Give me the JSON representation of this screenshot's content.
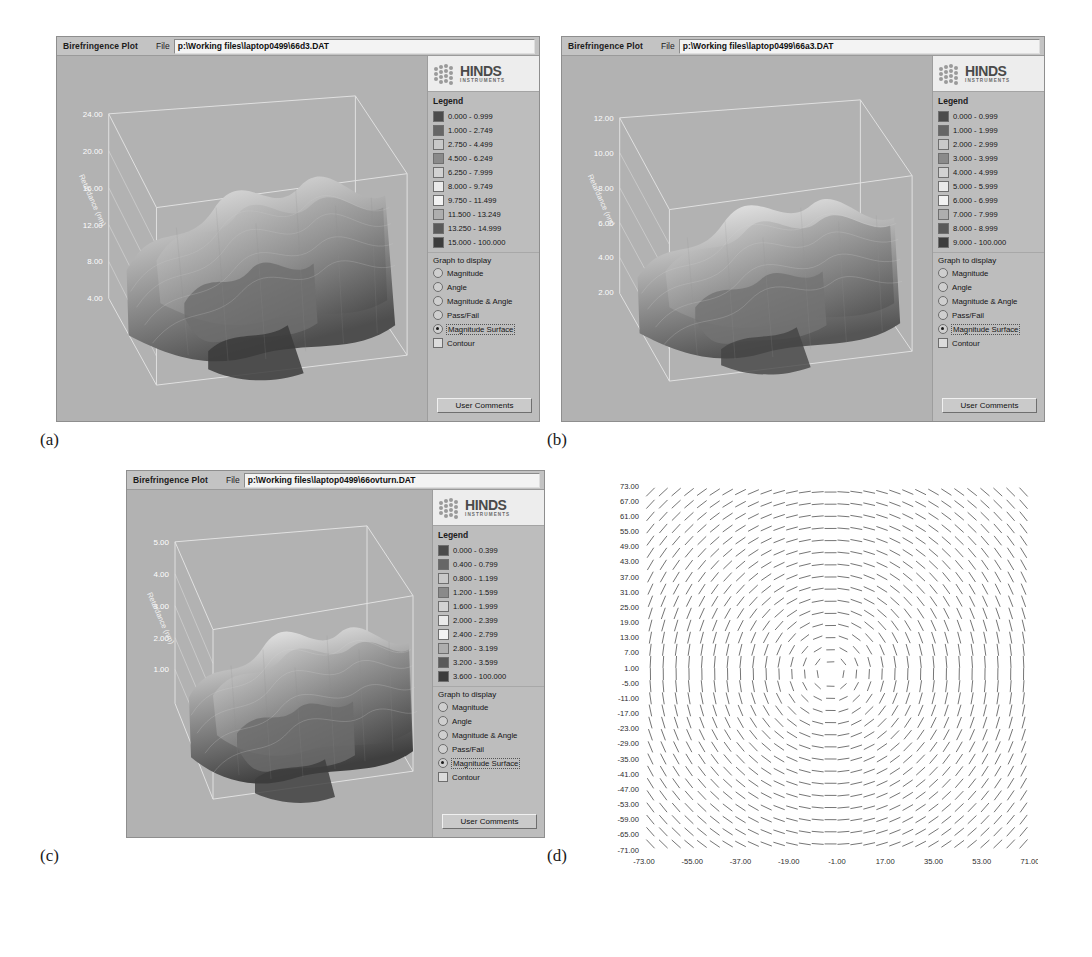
{
  "figure": {
    "panels": [
      {
        "caption": "(a)",
        "window": {
          "app_title": "Birefringence Plot",
          "file_label": "File",
          "file_value": "p:\\Working files\\laptop0499\\66d3.DAT"
        },
        "logo": {
          "name": "HINDS",
          "sub": "INSTRUMENTS"
        },
        "legend": {
          "title": "Legend",
          "entries": [
            {
              "label": "0.000 - 0.999",
              "color": "#4b4b4b"
            },
            {
              "label": "1.000 - 2.749",
              "color": "#666666"
            },
            {
              "label": "2.750 - 4.499",
              "color": "#c9c9c9"
            },
            {
              "label": "4.500 - 6.249",
              "color": "#8a8a8a"
            },
            {
              "label": "6.250 - 7.999",
              "color": "#d2d2d2"
            },
            {
              "label": "8.000 - 9.749",
              "color": "#eaeaea"
            },
            {
              "label": "9.750 - 11.499",
              "color": "#f2f2f2"
            },
            {
              "label": "11.500 - 13.249",
              "color": "#aeaeae"
            },
            {
              "label": "13.250 - 14.999",
              "color": "#5a5a5a"
            },
            {
              "label": "15.000 - 100.000",
              "color": "#3c3c3c"
            }
          ]
        },
        "graph_to_display": {
          "title": "Graph to display",
          "options": [
            {
              "label": "Magnitude",
              "type": "radio",
              "selected": false
            },
            {
              "label": "Angle",
              "type": "radio",
              "selected": false
            },
            {
              "label": "Magnitude & Angle",
              "type": "radio",
              "selected": false
            },
            {
              "label": "Pass/Fail",
              "type": "radio",
              "selected": false
            },
            {
              "label": "Magnitude Surface",
              "type": "radio",
              "selected": true
            },
            {
              "label": "Contour",
              "type": "checkbox",
              "selected": false
            }
          ],
          "button": "User Comments"
        },
        "axis": {
          "z_label": "Retardance (nm)",
          "z_ticks": [
            "24.00",
            "20.00",
            "16.00",
            "12.00",
            "8.00",
            "4.00"
          ]
        }
      },
      {
        "caption": "(b)",
        "window": {
          "app_title": "Birefringence Plot",
          "file_label": "File",
          "file_value": "p:\\Working files\\laptop0499\\66a3.DAT"
        },
        "logo": {
          "name": "HINDS",
          "sub": "INSTRUMENTS"
        },
        "legend": {
          "title": "Legend",
          "entries": [
            {
              "label": "0.000 - 0.999",
              "color": "#4b4b4b"
            },
            {
              "label": "1.000 - 1.999",
              "color": "#666666"
            },
            {
              "label": "2.000 - 2.999",
              "color": "#c9c9c9"
            },
            {
              "label": "3.000 - 3.999",
              "color": "#8a8a8a"
            },
            {
              "label": "4.000 - 4.999",
              "color": "#d2d2d2"
            },
            {
              "label": "5.000 - 5.999",
              "color": "#eaeaea"
            },
            {
              "label": "6.000 - 6.999",
              "color": "#f2f2f2"
            },
            {
              "label": "7.000 - 7.999",
              "color": "#aeaeae"
            },
            {
              "label": "8.000 - 8.999",
              "color": "#5a5a5a"
            },
            {
              "label": "9.000 - 100.000",
              "color": "#3c3c3c"
            }
          ]
        },
        "graph_to_display": {
          "title": "Graph to display",
          "options": [
            {
              "label": "Magnitude",
              "type": "radio",
              "selected": false
            },
            {
              "label": "Angle",
              "type": "radio",
              "selected": false
            },
            {
              "label": "Magnitude & Angle",
              "type": "radio",
              "selected": false
            },
            {
              "label": "Pass/Fail",
              "type": "radio",
              "selected": false
            },
            {
              "label": "Magnitude Surface",
              "type": "radio",
              "selected": true
            },
            {
              "label": "Contour",
              "type": "checkbox",
              "selected": false
            }
          ],
          "button": "User Comments"
        },
        "axis": {
          "z_label": "Retardance (nm)",
          "z_ticks": [
            "12.00",
            "10.00",
            "8.00",
            "6.00",
            "4.00",
            "2.00"
          ]
        }
      },
      {
        "caption": "(c)",
        "window": {
          "app_title": "Birefringence Plot",
          "file_label": "File",
          "file_value": "p:\\Working files\\laptop0499\\66ovturn.DAT"
        },
        "logo": {
          "name": "HINDS",
          "sub": "INSTRUMENTS"
        },
        "legend": {
          "title": "Legend",
          "entries": [
            {
              "label": "0.000 - 0.399",
              "color": "#4b4b4b"
            },
            {
              "label": "0.400 - 0.799",
              "color": "#666666"
            },
            {
              "label": "0.800 - 1.199",
              "color": "#c9c9c9"
            },
            {
              "label": "1.200 - 1.599",
              "color": "#8a8a8a"
            },
            {
              "label": "1.600 - 1.999",
              "color": "#d2d2d2"
            },
            {
              "label": "2.000 - 2.399",
              "color": "#eaeaea"
            },
            {
              "label": "2.400 - 2.799",
              "color": "#f2f2f2"
            },
            {
              "label": "2.800 - 3.199",
              "color": "#aeaeae"
            },
            {
              "label": "3.200 - 3.599",
              "color": "#5a5a5a"
            },
            {
              "label": "3.600 - 100.000",
              "color": "#3c3c3c"
            }
          ]
        },
        "graph_to_display": {
          "title": "Graph to display",
          "options": [
            {
              "label": "Magnitude",
              "type": "radio",
              "selected": false
            },
            {
              "label": "Angle",
              "type": "radio",
              "selected": false
            },
            {
              "label": "Magnitude & Angle",
              "type": "radio",
              "selected": false
            },
            {
              "label": "Pass/Fail",
              "type": "radio",
              "selected": false
            },
            {
              "label": "Magnitude Surface",
              "type": "radio",
              "selected": true
            },
            {
              "label": "Contour",
              "type": "checkbox",
              "selected": false
            }
          ],
          "button": "User Comments"
        },
        "axis": {
          "z_label": "Retardance (nm)",
          "z_ticks": [
            "5.00",
            "4.00",
            "3.00",
            "2.00",
            "1.00"
          ]
        }
      }
    ],
    "vector_panel": {
      "caption": "(d)",
      "y_ticks": [
        "73.00",
        "67.00",
        "61.00",
        "55.00",
        "49.00",
        "43.00",
        "37.00",
        "31.00",
        "25.00",
        "19.00",
        "13.00",
        "7.00",
        "1.00",
        "-5.00",
        "-11.00",
        "-17.00",
        "-23.00",
        "-29.00",
        "-35.00",
        "-41.00",
        "-47.00",
        "-53.00",
        "-59.00",
        "-65.00",
        "-71.00"
      ],
      "x_ticks": [
        "-73.00",
        "-55.00",
        "-37.00",
        "-19.00",
        "-1.00",
        "17.00",
        "35.00",
        "53.00",
        "71.00"
      ]
    }
  },
  "chart_data": {
    "type": "scatter",
    "panels": [
      {
        "id": "a",
        "type": "surface",
        "file": "p:\\Working files\\laptop0499\\66d3.DAT",
        "zlabel": "Retardance (nm)",
        "z_ticks": [
          24.0,
          20.0,
          16.0,
          12.0,
          8.0,
          4.0
        ],
        "zlim": [
          0,
          24
        ],
        "legend_bins": [
          [
            0.0,
            0.999
          ],
          [
            1.0,
            2.749
          ],
          [
            2.75,
            4.499
          ],
          [
            4.5,
            6.249
          ],
          [
            6.25,
            7.999
          ],
          [
            8.0,
            9.749
          ],
          [
            9.75,
            11.499
          ],
          [
            11.5,
            13.249
          ],
          [
            13.25,
            14.999
          ],
          [
            15.0,
            100.0
          ]
        ]
      },
      {
        "id": "b",
        "type": "surface",
        "file": "p:\\Working files\\laptop0499\\66a3.DAT",
        "zlabel": "Retardance (nm)",
        "z_ticks": [
          12.0,
          10.0,
          8.0,
          6.0,
          4.0,
          2.0
        ],
        "zlim": [
          0,
          12
        ],
        "legend_bins": [
          [
            0.0,
            0.999
          ],
          [
            1.0,
            1.999
          ],
          [
            2.0,
            2.999
          ],
          [
            3.0,
            3.999
          ],
          [
            4.0,
            4.999
          ],
          [
            5.0,
            5.999
          ],
          [
            6.0,
            6.999
          ],
          [
            7.0,
            7.999
          ],
          [
            8.0,
            8.999
          ],
          [
            9.0,
            100.0
          ]
        ]
      },
      {
        "id": "c",
        "type": "surface",
        "file": "p:\\Working files\\laptop0499\\66ovturn.DAT",
        "zlabel": "Retardance (nm)",
        "z_ticks": [
          5.0,
          4.0,
          3.0,
          2.0,
          1.0
        ],
        "zlim": [
          0,
          5
        ],
        "legend_bins": [
          [
            0.0,
            0.399
          ],
          [
            0.4,
            0.799
          ],
          [
            0.8,
            1.199
          ],
          [
            1.2,
            1.599
          ],
          [
            1.6,
            1.999
          ],
          [
            2.0,
            2.399
          ],
          [
            2.4,
            2.799
          ],
          [
            2.8,
            3.199
          ],
          [
            3.2,
            3.599
          ],
          [
            3.6,
            100.0
          ]
        ]
      },
      {
        "id": "d",
        "type": "quiver",
        "xlim": [
          -73,
          71
        ],
        "ylim": [
          -71,
          73
        ],
        "x_ticks": [
          -73,
          -55,
          -37,
          -19,
          -1,
          17,
          35,
          53,
          71
        ],
        "y_ticks": [
          73,
          67,
          61,
          55,
          49,
          43,
          37,
          31,
          25,
          19,
          13,
          7,
          1,
          -5,
          -11,
          -17,
          -23,
          -29,
          -35,
          -41,
          -47,
          -53,
          -59,
          -65,
          -71
        ],
        "grid": false,
        "description": "Fast-axis orientation vector field, circularly symmetric about centre"
      }
    ]
  }
}
